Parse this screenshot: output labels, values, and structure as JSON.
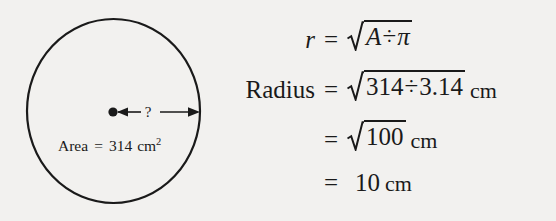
{
  "figure": {
    "background_color": "#f2f1ef",
    "ink_color": "#1a1a1a"
  },
  "diagram": {
    "shape": "circle",
    "center_dot": "center-point",
    "radius_arrow": {
      "label": "?",
      "description": "double-headed arrow from centre to circumference"
    },
    "area_label": {
      "name": "Area",
      "equals": "=",
      "value": "314",
      "unit": "cm",
      "exponent": "2",
      "full_text": "Area = 314 cm²"
    }
  },
  "equations": {
    "rows": [
      {
        "lhs": "r",
        "lhs_style": "italic",
        "equals": "=",
        "radical": true,
        "radicand_parts": [
          "A",
          "÷",
          "π"
        ],
        "radicand_text": "A ÷ π",
        "unit": "",
        "full_text": "r = √(A ÷ π)"
      },
      {
        "lhs": "Radius",
        "lhs_style": "upright",
        "equals": "=",
        "radical": true,
        "radicand_parts": [
          "314",
          "÷",
          "3.14"
        ],
        "radicand_text": "314 ÷ 3.14",
        "unit": "cm",
        "full_text": "Radius = √(314 ÷ 3.14) cm"
      },
      {
        "lhs": "",
        "lhs_style": "upright",
        "equals": "=",
        "radical": true,
        "radicand_parts": [
          "100"
        ],
        "radicand_text": "100",
        "unit": "cm",
        "full_text": "= √100 cm"
      },
      {
        "lhs": "",
        "lhs_style": "upright",
        "equals": "=",
        "radical": false,
        "radicand_parts": [
          "10"
        ],
        "radicand_text": "10",
        "unit": "cm",
        "full_text": "= 10 cm"
      }
    ]
  }
}
